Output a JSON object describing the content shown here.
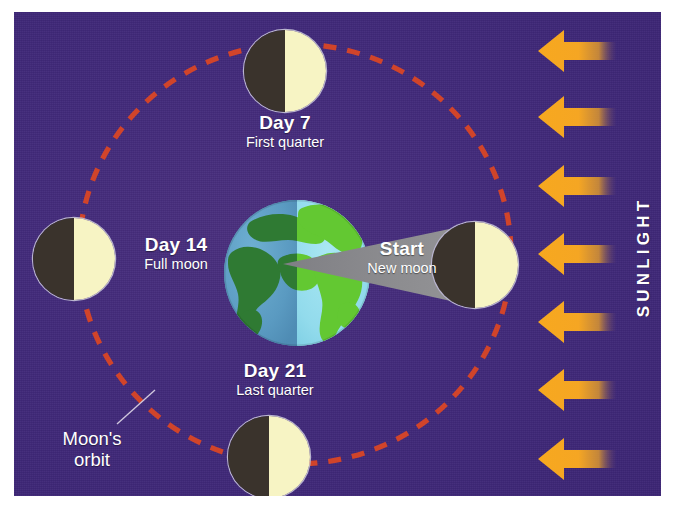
{
  "diagram": {
    "background_color": "#42287a",
    "border_color": "#ffffff"
  },
  "sunlight": {
    "caption": "SUNLIGHT",
    "arrow_count": 7,
    "arrow_color": "#f5a623",
    "arrow_direction": "left",
    "arrow_label": "sunlight-arrow"
  },
  "orbit": {
    "label_line1": "Moon's",
    "label_line2": "orbit",
    "dash_color": "#d1442a",
    "style": "dashed-ellipse"
  },
  "earth": {
    "name": "Earth",
    "night_ocean_color": "#5d9ec4",
    "night_land_color": "#2f7a33",
    "day_ocean_color": "#96dcec",
    "day_land_color": "#63c832"
  },
  "shadow_cone": {
    "name": "earth-shadow-cone",
    "color": "#8b8b8b"
  },
  "phases": [
    {
      "id": "new-moon",
      "title": "Start",
      "subtitle": "New moon",
      "day": 0,
      "position": "right",
      "dark_side": "left",
      "lit_side": "right"
    },
    {
      "id": "first-quarter",
      "title": "Day 7",
      "subtitle": "First quarter",
      "day": 7,
      "position": "top",
      "dark_side": "left",
      "lit_side": "right"
    },
    {
      "id": "full-moon",
      "title": "Day 14",
      "subtitle": "Full moon",
      "day": 14,
      "position": "left",
      "dark_side": "left",
      "lit_side": "right"
    },
    {
      "id": "last-quarter",
      "title": "Day 21",
      "subtitle": "Last quarter",
      "day": 21,
      "position": "bottom",
      "dark_side": "left",
      "lit_side": "right"
    }
  ],
  "moon_colors": {
    "dark": "#3a332c",
    "lit": "#f7f4c4",
    "rim": "#b9b4cf"
  }
}
